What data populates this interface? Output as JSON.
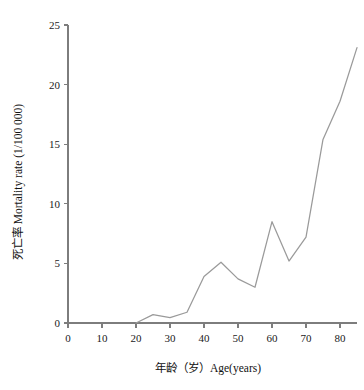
{
  "chart_data": {
    "type": "line",
    "title": "",
    "xlabel": "年龄（岁）Age(years)",
    "ylabel": "死亡率 Mortality rate (1/100 000)",
    "xlim": [
      0,
      87
    ],
    "ylim": [
      0,
      25
    ],
    "grid": false,
    "legend": false,
    "line_color": "#9a9a9a",
    "axis_color": "#7d7d7d",
    "x_ticks": [
      0,
      10,
      20,
      30,
      40,
      50,
      60,
      70,
      80
    ],
    "x_tick_labels": [
      "0",
      "10",
      "20",
      "30",
      "40",
      "50",
      "60",
      "70",
      "80"
    ],
    "y_ticks": [
      0,
      5,
      10,
      15,
      20,
      25
    ],
    "y_tick_labels": [
      "0",
      "5",
      "10",
      "15",
      "20",
      "25"
    ],
    "x": [
      20,
      25,
      30,
      35,
      40,
      45,
      50,
      55,
      60,
      65,
      70,
      75,
      80,
      85
    ],
    "values": [
      0.0,
      0.7,
      0.45,
      0.9,
      3.9,
      5.1,
      3.7,
      3.0,
      8.5,
      5.2,
      7.2,
      15.4,
      18.6,
      23.1
    ],
    "series": [
      {
        "name": "Mortality rate",
        "x": [
          20,
          25,
          30,
          35,
          40,
          45,
          50,
          55,
          60,
          65,
          70,
          75,
          80,
          85
        ],
        "values": [
          0.0,
          0.7,
          0.45,
          0.9,
          3.9,
          5.1,
          3.7,
          3.0,
          8.5,
          5.2,
          7.2,
          15.4,
          18.6,
          23.1
        ]
      }
    ]
  }
}
